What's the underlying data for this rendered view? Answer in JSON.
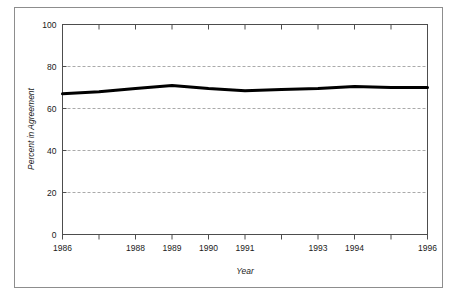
{
  "chart_data": {
    "type": "line",
    "title": "",
    "xlabel": "Year",
    "ylabel": "Percent in Agreement",
    "x": [
      1986,
      1987,
      1988,
      1989,
      1990,
      1991,
      1992,
      1993,
      1994,
      1995,
      1996
    ],
    "values": [
      67,
      68,
      69.5,
      71,
      69.5,
      68.5,
      69,
      69.5,
      70.5,
      70,
      70
    ],
    "series": [
      {
        "name": "Percent in Agreement",
        "values": [
          67,
          68,
          69.5,
          71,
          69.5,
          68.5,
          69,
          69.5,
          70.5,
          70,
          70
        ],
        "color": "#000000",
        "line_width": 3
      }
    ],
    "xlim": [
      1986,
      1996
    ],
    "ylim": [
      0,
      100
    ],
    "ytick_values": [
      0,
      20,
      40,
      60,
      80,
      100
    ],
    "ytick_labels": [
      "0",
      "20",
      "40",
      "60",
      "80",
      "100"
    ],
    "xtick_values": [
      1986,
      1987,
      1988,
      1989,
      1990,
      1991,
      1992,
      1993,
      1994,
      1995,
      1996
    ],
    "xtick_labels": [
      "1986",
      "",
      "1988",
      "1989",
      "1990",
      "1991",
      "",
      "1993",
      "1994",
      "",
      "1996"
    ],
    "grid": {
      "horizontal": true,
      "vertical": false,
      "style": "dashed",
      "color": "#aaaaaa",
      "at_values": [
        20,
        40,
        60,
        80
      ]
    },
    "legend": null,
    "frame_color": "#8d8d8d",
    "axis_color": "#4d4d4d",
    "background": "#ffffff"
  },
  "figure": {
    "outer_border_color": "#8d8d8d"
  }
}
